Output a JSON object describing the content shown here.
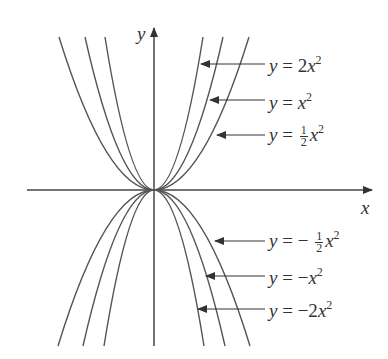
{
  "axes": {
    "x_label": "x",
    "y_label": "y"
  },
  "curves": [
    {
      "id": "pos2",
      "label_prefix": "y = 2x",
      "coef": "2",
      "sign": "",
      "exponent": "2"
    },
    {
      "id": "pos1",
      "label_prefix": "y = x",
      "coef": "",
      "sign": "",
      "exponent": "2"
    },
    {
      "id": "poshalf",
      "label_prefix": "y = ",
      "coef_num": "1",
      "coef_den": "2",
      "sign": "",
      "exponent": "2"
    },
    {
      "id": "neghalf",
      "label_prefix": "y = − ",
      "coef_num": "1",
      "coef_den": "2",
      "sign": "−",
      "exponent": "2"
    },
    {
      "id": "neg1",
      "label_prefix": "y = −x",
      "coef": "",
      "sign": "−",
      "exponent": "2"
    },
    {
      "id": "neg2",
      "label_prefix": "y = −2x",
      "coef": "2",
      "sign": "−",
      "exponent": "2"
    }
  ],
  "labels": {
    "pos2": {
      "y": "y",
      "eq": " = 2",
      "x": "x",
      "exp": "2"
    },
    "pos1": {
      "y": "y",
      "eq": " = ",
      "x": "x",
      "exp": "2"
    },
    "poshalf": {
      "y": "y",
      "eq": " = ",
      "num": "1",
      "den": "2",
      "x": "x",
      "exp": "2"
    },
    "neghalf": {
      "y": "y",
      "eq": " = − ",
      "num": "1",
      "den": "2",
      "x": "x",
      "exp": "2"
    },
    "neg1": {
      "y": "y",
      "eq": " = −",
      "x": "x",
      "exp": "2"
    },
    "neg2": {
      "y": "y",
      "eq": " = −2",
      "x": "x",
      "exp": "2"
    }
  },
  "colors": {
    "curve": "#555555",
    "axis": "#444444",
    "text": "#333333"
  }
}
